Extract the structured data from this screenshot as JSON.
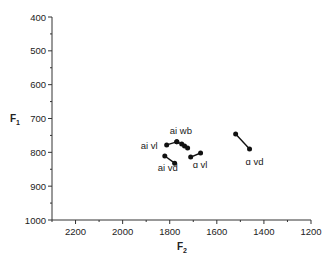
{
  "chart_data": {
    "type": "scatter",
    "title": "",
    "xlabel": "F2",
    "ylabel": "F1",
    "xlabel_main": "F",
    "xlabel_sub": "2",
    "ylabel_main": "F",
    "ylabel_sub": "1",
    "xlim": [
      2300,
      1200
    ],
    "ylim": [
      1000,
      400
    ],
    "x_inverted": true,
    "y_inverted": true,
    "grid": false,
    "legend": "none",
    "x_ticks": [
      2200,
      2000,
      1800,
      1600,
      1400,
      1200
    ],
    "y_ticks": [
      400,
      500,
      600,
      700,
      800,
      900,
      1000
    ],
    "series": [
      {
        "name": "ai vl",
        "label": "ai vl",
        "points": [
          [
            1813,
            778
          ],
          [
            1770,
            769
          ]
        ]
      },
      {
        "name": "ai wb",
        "label": "ai wb",
        "points": [
          [
            1770,
            769
          ],
          [
            1749,
            775
          ],
          [
            1737,
            781
          ],
          [
            1724,
            787
          ]
        ]
      },
      {
        "name": "ai vd",
        "label": "ai vd",
        "points": [
          [
            1821,
            811
          ],
          [
            1779,
            832
          ]
        ]
      },
      {
        "name": "a vl",
        "label": "ɑ vl",
        "points": [
          [
            1711,
            814
          ],
          [
            1669,
            802
          ]
        ]
      },
      {
        "name": "a vd",
        "label": "ɑ vd",
        "points": [
          [
            1520,
            746
          ],
          [
            1461,
            790
          ]
        ]
      }
    ]
  }
}
